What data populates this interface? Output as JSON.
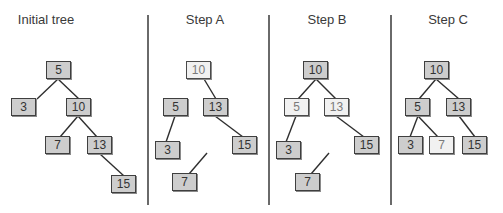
{
  "panels": [
    {
      "id": "initial",
      "title": "Initial tree",
      "title_x": 6,
      "title_w": 80,
      "nodes": [
        {
          "id": "n5",
          "label": "5",
          "x": 46,
          "y": 61,
          "highlight": false
        },
        {
          "id": "n3",
          "label": "3",
          "x": 11,
          "y": 98,
          "highlight": false
        },
        {
          "id": "n10",
          "label": "10",
          "x": 66,
          "y": 98,
          "highlight": false
        },
        {
          "id": "n7",
          "label": "7",
          "x": 45,
          "y": 136,
          "highlight": false
        },
        {
          "id": "n13",
          "label": "13",
          "x": 87,
          "y": 136,
          "highlight": false
        },
        {
          "id": "n15",
          "label": "15",
          "x": 111,
          "y": 175,
          "highlight": false
        }
      ],
      "edges": [
        {
          "from": "5",
          "to": "3",
          "x1": 58,
          "y1": 79,
          "x2": 37,
          "y2": 99
        },
        {
          "from": "5",
          "to": "10",
          "x1": 58,
          "y1": 79,
          "x2": 79,
          "y2": 99
        },
        {
          "from": "10",
          "to": "7",
          "x1": 78,
          "y1": 116,
          "x2": 60,
          "y2": 137
        },
        {
          "from": "10",
          "to": "13",
          "x1": 78,
          "y1": 116,
          "x2": 97,
          "y2": 137
        },
        {
          "from": "13",
          "to": "15",
          "x1": 100,
          "y1": 154,
          "x2": 124,
          "y2": 176
        }
      ]
    },
    {
      "id": "step-a",
      "title": "Step A",
      "title_x": 175,
      "title_w": 60,
      "nodes": [
        {
          "id": "n10",
          "label": "10",
          "x": 186,
          "y": 61,
          "highlight": true
        },
        {
          "id": "n5",
          "label": "5",
          "x": 163,
          "y": 98,
          "highlight": false
        },
        {
          "id": "n13",
          "label": "13",
          "x": 203,
          "y": 98,
          "highlight": false
        },
        {
          "id": "n3",
          "label": "3",
          "x": 155,
          "y": 141,
          "highlight": false
        },
        {
          "id": "n15",
          "label": "15",
          "x": 232,
          "y": 136,
          "highlight": false
        },
        {
          "id": "n7",
          "label": "7",
          "x": 172,
          "y": 173,
          "highlight": false
        }
      ],
      "edges": [
        {
          "from": "10",
          "to": "13",
          "x1": 204,
          "y1": 79,
          "x2": 216,
          "y2": 99
        },
        {
          "from": "5",
          "to": "3",
          "x1": 175,
          "y1": 116,
          "x2": 166,
          "y2": 142
        },
        {
          "from": "13",
          "to": "15",
          "x1": 215,
          "y1": 116,
          "x2": 243,
          "y2": 137
        },
        {
          "from": "detached",
          "to": "7",
          "x1": 207,
          "y1": 153,
          "x2": 189,
          "y2": 174
        }
      ]
    },
    {
      "id": "step-b",
      "title": "Step B",
      "title_x": 297,
      "title_w": 60,
      "nodes": [
        {
          "id": "n10",
          "label": "10",
          "x": 303,
          "y": 61,
          "highlight": false
        },
        {
          "id": "n5",
          "label": "5",
          "x": 284,
          "y": 98,
          "highlight": true
        },
        {
          "id": "n13",
          "label": "13",
          "x": 324,
          "y": 98,
          "highlight": true
        },
        {
          "id": "n3",
          "label": "3",
          "x": 276,
          "y": 141,
          "highlight": false
        },
        {
          "id": "n15",
          "label": "15",
          "x": 354,
          "y": 136,
          "highlight": false
        },
        {
          "id": "n7",
          "label": "7",
          "x": 295,
          "y": 173,
          "highlight": false
        }
      ],
      "edges": [
        {
          "from": "10",
          "to": "5",
          "x1": 316,
          "y1": 79,
          "x2": 298,
          "y2": 99
        },
        {
          "from": "10",
          "to": "13",
          "x1": 316,
          "y1": 79,
          "x2": 336,
          "y2": 99
        },
        {
          "from": "5",
          "to": "3",
          "x1": 296,
          "y1": 116,
          "x2": 286,
          "y2": 142
        },
        {
          "from": "13",
          "to": "15",
          "x1": 336,
          "y1": 116,
          "x2": 364,
          "y2": 137
        },
        {
          "from": "detached",
          "to": "7",
          "x1": 329,
          "y1": 153,
          "x2": 311,
          "y2": 174
        }
      ]
    },
    {
      "id": "step-c",
      "title": "Step C",
      "title_x": 418,
      "title_w": 60,
      "nodes": [
        {
          "id": "n10",
          "label": "10",
          "x": 424,
          "y": 61,
          "highlight": false
        },
        {
          "id": "n5",
          "label": "5",
          "x": 405,
          "y": 98,
          "highlight": false
        },
        {
          "id": "n13",
          "label": "13",
          "x": 446,
          "y": 98,
          "highlight": false
        },
        {
          "id": "n3",
          "label": "3",
          "x": 398,
          "y": 136,
          "highlight": false
        },
        {
          "id": "n7",
          "label": "7",
          "x": 429,
          "y": 136,
          "highlight": true
        },
        {
          "id": "n15",
          "label": "15",
          "x": 462,
          "y": 136,
          "highlight": false
        }
      ],
      "edges": [
        {
          "from": "10",
          "to": "5",
          "x1": 436,
          "y1": 79,
          "x2": 419,
          "y2": 99
        },
        {
          "from": "10",
          "to": "13",
          "x1": 436,
          "y1": 79,
          "x2": 459,
          "y2": 99
        },
        {
          "from": "5",
          "to": "3",
          "x1": 418,
          "y1": 116,
          "x2": 410,
          "y2": 137
        },
        {
          "from": "5",
          "to": "7",
          "x1": 418,
          "y1": 116,
          "x2": 438,
          "y2": 137
        },
        {
          "from": "13",
          "to": "15",
          "x1": 459,
          "y1": 116,
          "x2": 475,
          "y2": 137
        }
      ]
    }
  ],
  "dividers": [
    147,
    268,
    390
  ],
  "colors": {
    "node_fill": "#cdcdcd",
    "node_highlight_fill": "#f1f1f1",
    "node_border": "#3f3f3f",
    "edge": "#2e2e2e",
    "divider": "#6a6a6a"
  }
}
